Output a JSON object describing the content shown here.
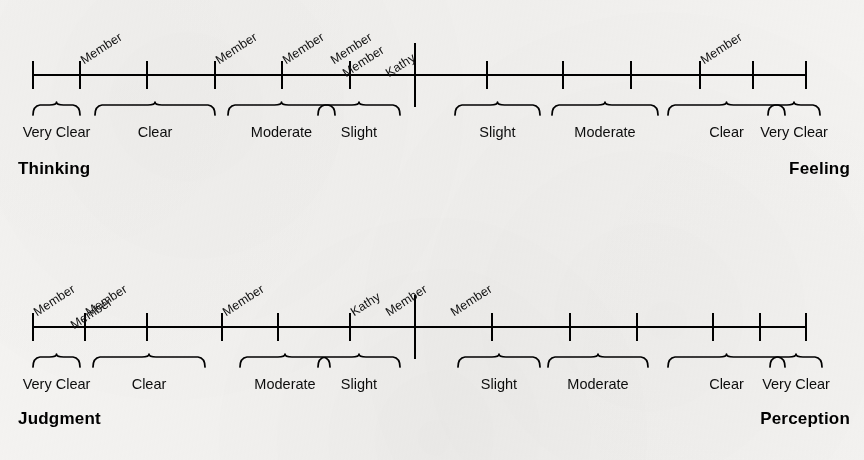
{
  "figure": {
    "background_color": "#f4f3f1",
    "ink_color": "#000000",
    "width": 864,
    "height": 460
  },
  "chart_data": {
    "type": "scatter",
    "title": "",
    "subtitle": "",
    "xlabel": "",
    "ylabel": "",
    "grid": false,
    "legend_position": "none",
    "scales": [
      {
        "id": "thinking-feeling",
        "left_pole": "Thinking",
        "right_pole": "Feeling",
        "axis_ticks": [
          33,
          80,
          147,
          215,
          282,
          350,
          415,
          487,
          563,
          631,
          700,
          753,
          806
        ],
        "center_divider": 415,
        "categories_left": [
          {
            "label": "Very Clear",
            "start": 33,
            "end": 80
          },
          {
            "label": "Clear",
            "start": 95,
            "end": 215
          },
          {
            "label": "Moderate",
            "start": 228,
            "end": 335
          },
          {
            "label": "Slight",
            "start": 318,
            "end": 400
          }
        ],
        "categories_right": [
          {
            "label": "Slight",
            "start": 455,
            "end": 540
          },
          {
            "label": "Moderate",
            "start": 552,
            "end": 658
          },
          {
            "label": "Clear",
            "start": 668,
            "end": 785
          },
          {
            "label": "Very Clear",
            "start": 768,
            "end": 820
          }
        ],
        "markers": [
          {
            "label": "Member",
            "x": 80,
            "row": 0
          },
          {
            "label": "Member",
            "x": 215,
            "row": 0
          },
          {
            "label": "Member",
            "x": 282,
            "row": 0
          },
          {
            "label": "Member",
            "x": 330,
            "row": 0
          },
          {
            "label": "Member",
            "x": 342,
            "row": 1
          },
          {
            "label": "Kathy",
            "x": 385,
            "row": 1
          },
          {
            "label": "Member",
            "x": 700,
            "row": 0
          }
        ]
      },
      {
        "id": "judgment-perception",
        "left_pole": "Judgment",
        "right_pole": "Perception",
        "axis_ticks": [
          33,
          85,
          147,
          222,
          278,
          350,
          415,
          492,
          570,
          637,
          713,
          760,
          806
        ],
        "center_divider": 415,
        "categories_left": [
          {
            "label": "Very Clear",
            "start": 33,
            "end": 80
          },
          {
            "label": "Clear",
            "start": 93,
            "end": 205
          },
          {
            "label": "Moderate",
            "start": 240,
            "end": 330
          },
          {
            "label": "Slight",
            "start": 318,
            "end": 400
          }
        ],
        "categories_right": [
          {
            "label": "Slight",
            "start": 458,
            "end": 540
          },
          {
            "label": "Moderate",
            "start": 548,
            "end": 648
          },
          {
            "label": "Clear",
            "start": 668,
            "end": 785
          },
          {
            "label": "Very Clear",
            "start": 770,
            "end": 822
          }
        ],
        "markers": [
          {
            "label": "Member",
            "x": 33,
            "row": 0
          },
          {
            "label": "Member",
            "x": 85,
            "row": 0
          },
          {
            "label": "Member",
            "x": 70,
            "row": 1
          },
          {
            "label": "Member",
            "x": 222,
            "row": 0
          },
          {
            "label": "Kathy",
            "x": 350,
            "row": 0
          },
          {
            "label": "Member",
            "x": 385,
            "row": 0
          },
          {
            "label": "Member",
            "x": 450,
            "row": 0
          }
        ]
      }
    ]
  }
}
